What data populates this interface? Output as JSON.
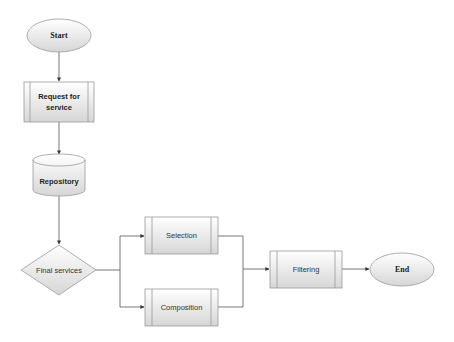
{
  "diagram": {
    "type": "flowchart",
    "nodes": {
      "start": {
        "label": "Start",
        "shape": "ellipse"
      },
      "request": {
        "label_line1": "Request for",
        "label_line2": "service",
        "shape": "predefined-process"
      },
      "repository": {
        "label": "Repository",
        "shape": "cylinder"
      },
      "final_services": {
        "label": "Final services",
        "shape": "diamond"
      },
      "selection": {
        "label": "Selection",
        "shape": "predefined-process"
      },
      "composition": {
        "label": "Composition",
        "shape": "predefined-process"
      },
      "filtering": {
        "label": "Filtering",
        "shape": "predefined-process"
      },
      "end": {
        "label": "End",
        "shape": "ellipse"
      }
    },
    "edges": [
      {
        "from": "start",
        "to": "request"
      },
      {
        "from": "request",
        "to": "repository"
      },
      {
        "from": "repository",
        "to": "final_services"
      },
      {
        "from": "final_services",
        "to": "selection"
      },
      {
        "from": "final_services",
        "to": "composition"
      },
      {
        "from": "selection",
        "to": "filtering"
      },
      {
        "from": "composition",
        "to": "filtering"
      },
      {
        "from": "filtering",
        "to": "end"
      }
    ],
    "colors": {
      "fill_top": "#ffffff",
      "fill_bottom": "#d9d9d9",
      "stroke": "#9a9a9a",
      "edge": "#555555"
    }
  }
}
